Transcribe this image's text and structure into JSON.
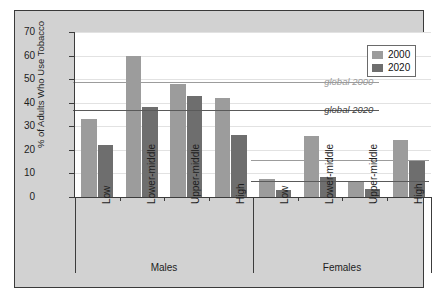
{
  "chart_data": {
    "type": "bar",
    "title": "",
    "subtitle": "",
    "xlabel": "",
    "ylabel": "% of Adults Who Use Tobacco",
    "ylim": [
      0,
      70
    ],
    "ytick_values": [
      0,
      10,
      20,
      30,
      40,
      50,
      60,
      70
    ],
    "ytick_labels": [
      "0",
      "10",
      "20",
      "30",
      "40",
      "50",
      "60",
      "70"
    ],
    "grid": true,
    "legend_position": "top-right",
    "legend_entries": [
      "2000",
      "2020"
    ],
    "groups": [
      "Males",
      "Females"
    ],
    "categories": [
      "Low",
      "Lower-middle",
      "Upper-middle",
      "High"
    ],
    "series": [
      {
        "name": "2000",
        "color": "#9c9c9c",
        "values_by_group": {
          "Males": [
            33,
            60,
            48,
            42
          ],
          "Females": [
            7.5,
            26,
            6.5,
            24
          ]
        }
      },
      {
        "name": "2020",
        "color": "#6e6e6e",
        "values_by_group": {
          "Males": [
            22,
            38,
            43,
            26.5
          ],
          "Females": [
            3,
            8.5,
            3.5,
            15.5
          ]
        }
      }
    ],
    "reference_lines": [
      {
        "label": "global 2000",
        "group": "Males",
        "value": 49,
        "color": "#9c9c9c"
      },
      {
        "label": "global 2020",
        "group": "Males",
        "value": 36.7,
        "color": "#5a5a5a"
      },
      {
        "label": "",
        "group": "Females",
        "value": 15.5,
        "color": "#9c9c9c"
      },
      {
        "label": "",
        "group": "Females",
        "value": 6.7,
        "color": "#5a5a5a"
      }
    ],
    "annotations": [
      {
        "text": "global 2000",
        "style": "italic"
      },
      {
        "text": "global 2020",
        "style": "italic"
      }
    ]
  },
  "axis": {
    "y_title": "% of Adults Who Use Tobacco",
    "ticks": [
      "70",
      "60",
      "50",
      "40",
      "30",
      "20",
      "10",
      "0"
    ]
  },
  "legend": {
    "items": [
      {
        "label": "2000",
        "color": "#9c9c9c"
      },
      {
        "label": "2020",
        "color": "#6e6e6e"
      }
    ]
  },
  "groups": [
    {
      "name": "Males",
      "categories": [
        "Low",
        "Lower-middle",
        "Upper-middle",
        "High"
      ]
    },
    {
      "name": "Females",
      "categories": [
        "Low",
        "Lower-middle",
        "Upper-middle",
        "High"
      ]
    }
  ],
  "reference_labels": {
    "global_2000": "global 2000",
    "global_2020": "global 2020"
  },
  "colors": {
    "series_2000": "#9c9c9c",
    "series_2020": "#6e6e6e",
    "plate": "#d2d2d2",
    "plot_bg": "#ffffff",
    "axis": "#3c3c3c",
    "grid": "#e2e2e2"
  }
}
